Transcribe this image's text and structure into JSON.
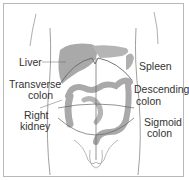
{
  "diagram": {
    "colors": {
      "organ": "#a9a9a9",
      "outline": "#666666",
      "frame": "#b8b8b8",
      "text": "#333333"
    },
    "labels": {
      "liver": "Liver",
      "transverse_colon_1": "Transverse",
      "transverse_colon_2": "colon",
      "right_kidney_1": "Right",
      "right_kidney_2": "kidney",
      "spleen": "Spleen",
      "descending_colon_1": "Descending",
      "descending_colon_2": "colon",
      "sigmoid_colon_1": "Sigmoid",
      "sigmoid_colon_2": "colon"
    }
  }
}
